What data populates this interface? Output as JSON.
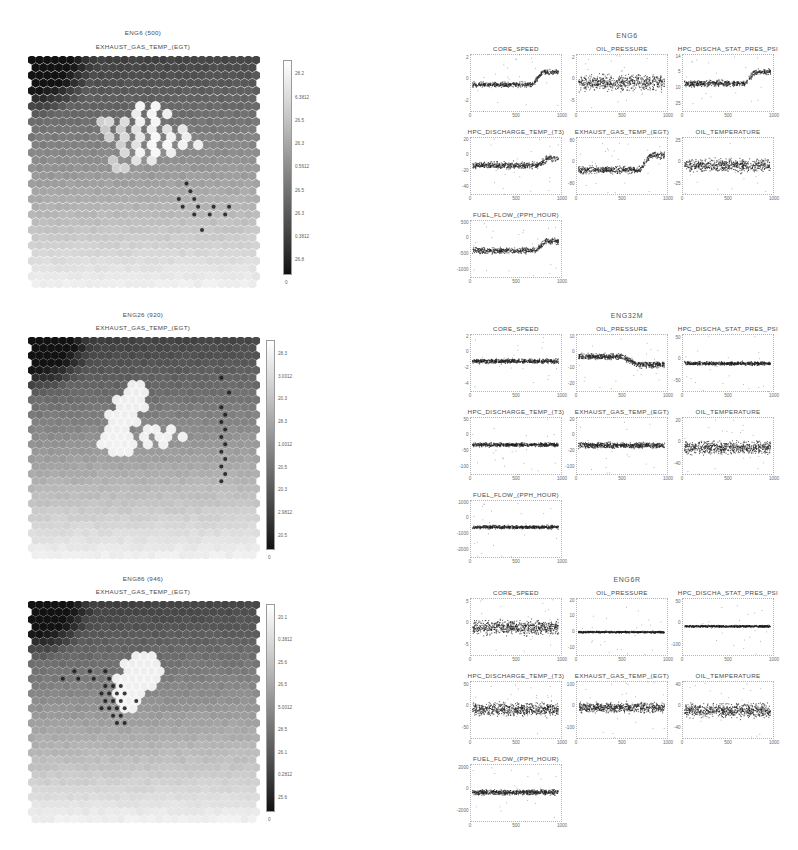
{
  "figure": {
    "type": "som-component-planes-with-scatter-matrix",
    "background": "#ffffff",
    "width": 798,
    "height": 850
  },
  "chart_data": {
    "type": "scatter",
    "panels": [
      {
        "row": 1,
        "som": {
          "map_title": "ENG6 (500)",
          "plane_title": "EXHAUST_GAS_TEMP_(EGT)",
          "grid": "hexagonal",
          "cols": 30,
          "rows": 30,
          "colorbar": {
            "min_label": "0",
            "ticks": [
              "28.2",
              "6.3812",
              "26.5",
              "26.3",
              "0.5612",
              "26.5",
              "26.3",
              "0.3812",
              "26.8"
            ]
          }
        },
        "scatter": {
          "title": "ENG6",
          "xlabel": "",
          "ylabel": "",
          "xticks": [
            "0",
            "500",
            "1000"
          ],
          "xlim": [
            0,
            1000
          ],
          "subplots": [
            {
              "title": "CORE_SPEED",
              "yticks": [
                "2",
                "0",
                "-2"
              ],
              "xticks": [
                "0",
                "500",
                "1000"
              ]
            },
            {
              "title": "OIL_PRESSURE",
              "yticks": [
                "2",
                "0",
                "-5"
              ],
              "xticks": [
                "0",
                "500",
                "1000"
              ]
            },
            {
              "title": "HPC_DISCHA_STAT_PRES_PSI",
              "yticks": [
                "14",
                "5",
                "10",
                "25"
              ],
              "xticks": [
                "0",
                "500",
                "1000"
              ]
            },
            {
              "title": "HPC_DISCHARGE_TEMP_(T3)",
              "yticks": [
                "20",
                "0",
                "-20",
                "-40"
              ],
              "xticks": [
                "0",
                "500",
                "1000"
              ]
            },
            {
              "title": "EXHAUST_GAS_TEMP_(EGT)",
              "yticks": [
                "80",
                "0",
                "-80"
              ],
              "xticks": [
                "0",
                "500",
                "1000"
              ]
            },
            {
              "title": "OIL_TEMPERATURE",
              "yticks": [
                "25",
                "0",
                "-25"
              ],
              "xticks": [
                "0",
                "500",
                "1000"
              ]
            },
            {
              "title": "FUEL_FLOW_(PPH_HOUR)",
              "yticks": [
                "500",
                "0",
                "-500",
                "-1000"
              ],
              "xticks": [
                "0",
                "500",
                "1000"
              ]
            }
          ]
        }
      },
      {
        "row": 2,
        "som": {
          "map_title": "ENG26 (920)",
          "plane_title": "EXHAUST_GAS_TEMP_(EGT)",
          "grid": "hexagonal",
          "cols": 30,
          "rows": 30,
          "colorbar": {
            "min_label": "0",
            "ticks": [
              "28.3",
              "3.0012",
              "20.3",
              "28.3",
              "1.0012",
              "20.5",
              "20.3",
              "2.9812",
              "20.5"
            ]
          }
        },
        "scatter": {
          "title": "ENG32M",
          "xlabel": "",
          "ylabel": "",
          "xticks": [
            "0",
            "500",
            "1000"
          ],
          "xlim": [
            0,
            1000
          ],
          "subplots": [
            {
              "title": "CORE_SPEED",
              "yticks": [
                "2",
                "0",
                "-2",
                "-4"
              ],
              "xticks": [
                "0",
                "500",
                "1000"
              ]
            },
            {
              "title": "OIL_PRESSURE",
              "yticks": [
                "10",
                "0",
                "-10",
                "-20"
              ],
              "xticks": [
                "0",
                "500",
                "1000"
              ]
            },
            {
              "title": "HPC_DISCHA_STAT_PRES_PSI",
              "yticks": [
                "50",
                "0",
                "-50"
              ],
              "xticks": [
                "0",
                "500",
                "1000"
              ]
            },
            {
              "title": "HPC_DISCHARGE_TEMP_(T3)",
              "yticks": [
                "50",
                "0",
                "-50",
                "-100"
              ],
              "xticks": [
                "0",
                "500",
                "1000"
              ]
            },
            {
              "title": "EXHAUST_GAS_TEMP_(EGT)",
              "yticks": [
                "20",
                "0",
                "-20",
                "-100"
              ],
              "xticks": [
                "0",
                "500",
                "1000"
              ]
            },
            {
              "title": "OIL_TEMPERATURE",
              "yticks": [
                "20",
                "0",
                "-40"
              ],
              "xticks": [
                "0",
                "500",
                "1000"
              ]
            },
            {
              "title": "FUEL_FLOW_(PPH_HOUR)",
              "yticks": [
                "1000",
                "0",
                "-1000",
                "-2000"
              ],
              "xticks": [
                "0",
                "500",
                "1000"
              ]
            }
          ]
        }
      },
      {
        "row": 3,
        "som": {
          "map_title": "ENG86 (946)",
          "plane_title": "EXHAUST_GAS_TEMP_(EGT)",
          "grid": "hexagonal",
          "cols": 30,
          "rows": 30,
          "colorbar": {
            "min_label": "0",
            "ticks": [
              "20.1",
              "0.3812",
              "25.6",
              "26.5",
              "5.0012",
              "28.5",
              "26.1",
              "0.2812",
              "25.6"
            ]
          }
        },
        "scatter": {
          "title": "ENG6R",
          "xlabel": "",
          "ylabel": "",
          "xticks": [
            "0",
            "500",
            "1000"
          ],
          "xlim": [
            0,
            1000
          ],
          "subplots": [
            {
              "title": "CORE_SPEED",
              "yticks": [
                "5",
                "0",
                "-5"
              ],
              "xticks": [
                "0",
                "500",
                "1000"
              ]
            },
            {
              "title": "OIL_PRESSURE",
              "yticks": [
                "20",
                "10",
                "0",
                "-10"
              ],
              "xticks": [
                "0",
                "500",
                "1000"
              ]
            },
            {
              "title": "HPC_DISCHA_STAT_PRES_PSI",
              "yticks": [
                "50",
                "0",
                "-100"
              ],
              "xticks": [
                "0",
                "500",
                "1000"
              ]
            },
            {
              "title": "HPC_DISCHARGE_TEMP_(T3)",
              "yticks": [
                "50",
                "0",
                "-50"
              ],
              "xticks": [
                "0",
                "500",
                "1000"
              ]
            },
            {
              "title": "EXHAUST_GAS_TEMP_(EGT)",
              "yticks": [
                "100",
                "0",
                "-100"
              ],
              "xticks": [
                "0",
                "500",
                "1000"
              ]
            },
            {
              "title": "OIL_TEMPERATURE",
              "yticks": [
                "40",
                "0",
                "-40"
              ],
              "xticks": [
                "0",
                "500",
                "1000"
              ]
            },
            {
              "title": "FUEL_FLOW_(PPH_HOUR)",
              "yticks": [
                "2000",
                "0",
                "-2000"
              ],
              "xticks": [
                "0",
                "500",
                "1000"
              ]
            }
          ]
        }
      }
    ]
  }
}
